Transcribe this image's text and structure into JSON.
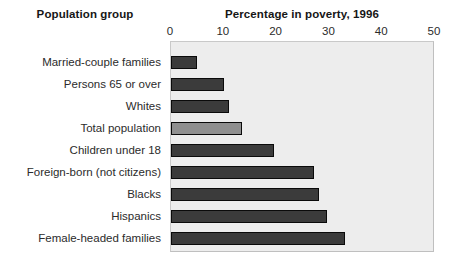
{
  "headings": {
    "group": "Population group",
    "value": "Percentage in poverty, 1996"
  },
  "chart_data": {
    "type": "bar",
    "orientation": "horizontal",
    "title": "Percentage in poverty, 1996",
    "subtitle": "",
    "xlabel": "Percentage in poverty, 1996",
    "ylabel": "Population group",
    "xlim": [
      0,
      50
    ],
    "xticks": [
      0,
      10,
      20,
      30,
      40,
      50
    ],
    "xtick_labels": [
      "0",
      "10",
      "20",
      "30",
      "40",
      "50"
    ],
    "grid": false,
    "legend": null,
    "plot_background": "#ededed",
    "bar_color": "#3b3b3b",
    "highlight_bar_color": "#8f8f8f",
    "categories": [
      "Married-couple families",
      "Persons 65 or over",
      "Whites",
      "Total population",
      "Children under 18",
      "Foreign-born (not citizens)",
      "Blacks",
      "Hispanics",
      "Female-headed families"
    ],
    "values": [
      5,
      10,
      11,
      13.5,
      19.5,
      27,
      28,
      29.5,
      33
    ],
    "highlighted_categories": [
      "Total population"
    ],
    "annotations": []
  }
}
